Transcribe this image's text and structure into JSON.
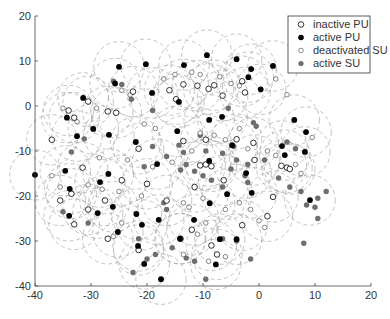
{
  "chart_data": {
    "type": "scatter",
    "title": "",
    "xlabel": "",
    "ylabel": "",
    "xlim": [
      -40,
      20
    ],
    "ylim": [
      -40,
      20
    ],
    "xticks": [
      -40,
      -30,
      -20,
      -10,
      0,
      10,
      20
    ],
    "yticks": [
      -40,
      -30,
      -20,
      -10,
      0,
      10,
      20
    ],
    "grid": false,
    "legend_position": "top-right",
    "coverage_radius": 4.5,
    "series": [
      {
        "name": "inactive PU",
        "marker": "open-circle-large",
        "color": "#000000",
        "points": [
          [
            -22.5,
            3.2
          ],
          [
            -16,
            3.5
          ],
          [
            -13.5,
            4.8
          ],
          [
            -11,
            4.5
          ],
          [
            -9,
            3.8
          ],
          [
            -8,
            4.6
          ],
          [
            -3,
            5.5
          ],
          [
            -30.5,
            1
          ],
          [
            -27,
            -1.2
          ],
          [
            -25.5,
            -1.5
          ],
          [
            -14.8,
            1.5
          ],
          [
            -6.5,
            2.3
          ],
          [
            -2.5,
            3
          ],
          [
            -34,
            -1
          ],
          [
            -33,
            -2.6
          ],
          [
            -37,
            -7.5
          ],
          [
            -21.5,
            -9.5
          ],
          [
            -13.5,
            -7.8
          ],
          [
            -9.5,
            -7.5
          ],
          [
            -4,
            -7.4
          ],
          [
            -1,
            -8.2
          ],
          [
            -31.5,
            -13.7
          ],
          [
            -24.5,
            -16.5
          ],
          [
            -35.5,
            -21
          ],
          [
            -33.5,
            -19.5
          ],
          [
            -30.5,
            -23
          ],
          [
            -27.5,
            -21
          ],
          [
            -20,
            -17.3
          ],
          [
            -16.5,
            -21
          ],
          [
            -11.5,
            -18
          ],
          [
            -10.5,
            -13.2
          ],
          [
            -9.5,
            -13
          ],
          [
            -8.5,
            -13.4
          ],
          [
            -6.3,
            -16.5
          ],
          [
            -0.8,
            -12
          ],
          [
            4,
            -13.3
          ],
          [
            5,
            -13.7
          ],
          [
            5.5,
            -14
          ],
          [
            2.5,
            -20.2
          ],
          [
            1.5,
            -24.5
          ],
          [
            -3,
            -26.5
          ],
          [
            -12,
            -27.5
          ],
          [
            -14,
            -29.5
          ],
          [
            -8.5,
            -31
          ],
          [
            -7.5,
            -33
          ],
          [
            -21.5,
            -32
          ],
          [
            -27,
            -29.5
          ],
          [
            -33,
            -26.3
          ]
        ]
      },
      {
        "name": "active PU",
        "marker": "filled-circle-large",
        "color": "#000000",
        "points": [
          [
            -25,
            8.7
          ],
          [
            -20.2,
            9.3
          ],
          [
            -13.4,
            9.1
          ],
          [
            -9.3,
            11.3
          ],
          [
            -4,
            10.4
          ],
          [
            -1.4,
            8.2
          ],
          [
            2.5,
            8.9
          ],
          [
            -31.4,
            1.8
          ],
          [
            -25.7,
            5
          ],
          [
            -19.1,
            2.9
          ],
          [
            -1.9,
            6.4
          ],
          [
            0.3,
            3.7
          ],
          [
            -34.3,
            -2.6
          ],
          [
            -29.6,
            -5.1
          ],
          [
            -26.8,
            -6.4
          ],
          [
            -32.5,
            -6.7
          ],
          [
            -22,
            -8
          ],
          [
            -14.6,
            -5.6
          ],
          [
            -14.3,
            0.9
          ],
          [
            -8.9,
            -3.1
          ],
          [
            -6.6,
            -2.4
          ],
          [
            6.3,
            -3.1
          ],
          [
            8.4,
            -5.8
          ],
          [
            4.6,
            -10.9
          ],
          [
            8.2,
            -10.2
          ],
          [
            -4.8,
            -8.7
          ],
          [
            -18.2,
            -12.9
          ],
          [
            -34.6,
            -14.4
          ],
          [
            -28.4,
            -16.9
          ],
          [
            -26.9,
            -15.1
          ],
          [
            -28.8,
            -23.8
          ],
          [
            -40,
            -15.3
          ],
          [
            -26.1,
            -22.4
          ],
          [
            -33.9,
            -24.4
          ],
          [
            -33.8,
            -18.4
          ],
          [
            -17.9,
            -25.3
          ],
          [
            -8.9,
            -12.2
          ],
          [
            -8.8,
            -21.6
          ],
          [
            -11.6,
            -25.3
          ],
          [
            -2.3,
            -14.9
          ],
          [
            -5.7,
            -19.6
          ],
          [
            9.1,
            -20.9
          ],
          [
            -7.0,
            -29.6
          ],
          [
            -4.0,
            -29.6
          ],
          [
            -1.3,
            -19.3
          ],
          [
            4.1,
            -8.9
          ],
          [
            -21.6,
            -31.1
          ],
          [
            -21.9,
            -24
          ],
          [
            -20.9,
            -26.4
          ],
          [
            -20.5,
            -35.1
          ],
          [
            -25.2,
            -28
          ],
          [
            -14.1,
            -29.5
          ],
          [
            -17.5,
            -38.5
          ],
          [
            -7.7,
            -35.2
          ]
        ]
      },
      {
        "name": "deactivated SU",
        "marker": "open-circle-small",
        "color": "#555555",
        "points": [
          [
            -35,
            -0.5
          ],
          [
            -32.5,
            -3.5
          ],
          [
            -29,
            -0.5
          ],
          [
            -24.5,
            3.5
          ],
          [
            -23,
            2.5
          ],
          [
            -17,
            6
          ],
          [
            -15,
            7
          ],
          [
            -12,
            7.5
          ],
          [
            -10.5,
            7
          ],
          [
            -7,
            6.5
          ],
          [
            -5,
            5
          ],
          [
            -3.5,
            4.5
          ],
          [
            3,
            6
          ],
          [
            5,
            2.5
          ],
          [
            -20.5,
            -4
          ],
          [
            -18.5,
            -5
          ],
          [
            -10.5,
            -6
          ],
          [
            -8,
            -6.5
          ],
          [
            -6,
            -7.5
          ],
          [
            -3.5,
            -5
          ],
          [
            -2,
            -9.5
          ],
          [
            1.5,
            -10
          ],
          [
            3,
            -11
          ],
          [
            6.5,
            -13
          ],
          [
            7.5,
            -15
          ],
          [
            9.5,
            -7
          ],
          [
            -28.5,
            -11.5
          ],
          [
            -23.5,
            -12
          ],
          [
            -19,
            -13.5
          ],
          [
            -15.5,
            -12.5
          ],
          [
            -12,
            -10
          ],
          [
            -30.5,
            -17.5
          ],
          [
            -28,
            -18.5
          ],
          [
            -25,
            -19
          ],
          [
            -21,
            -20
          ],
          [
            -35.5,
            -18
          ],
          [
            -37,
            -15.5
          ],
          [
            -26,
            -29
          ],
          [
            -24.5,
            -26
          ],
          [
            -13.5,
            -21.5
          ],
          [
            -12.5,
            -22.5
          ],
          [
            -10,
            -20.5
          ],
          [
            -6,
            -23
          ],
          [
            -3.5,
            -21.5
          ],
          [
            -1.5,
            -23
          ],
          [
            0,
            -25.5
          ],
          [
            1,
            -27
          ],
          [
            -9.5,
            -26
          ],
          [
            -11,
            -28.5
          ],
          [
            -13.5,
            -33
          ],
          [
            -9,
            -34.5
          ],
          [
            -6,
            -33.5
          ]
        ]
      },
      {
        "name": "active SU",
        "marker": "filled-circle-gray",
        "color": "#6e6e6e",
        "points": [
          [
            -26,
            5.5
          ],
          [
            -24.5,
            4.8
          ],
          [
            -19,
            -1
          ],
          [
            -22.8,
            1.5
          ],
          [
            -31.2,
            -7.3
          ],
          [
            -33.5,
            -10.2
          ],
          [
            -14.3,
            -8.7
          ],
          [
            -13.5,
            -10.3
          ],
          [
            -10.5,
            -6.5
          ],
          [
            -5.5,
            -0.5
          ],
          [
            -1,
            -3.7
          ],
          [
            -0.5,
            -4.5
          ],
          [
            5,
            -8
          ],
          [
            6.5,
            -9.5
          ],
          [
            -16.5,
            -11.2
          ],
          [
            -9.5,
            -10
          ],
          [
            -6.5,
            -10.5
          ],
          [
            -4.5,
            -9
          ],
          [
            -4,
            -12
          ],
          [
            -2.5,
            -15.5
          ],
          [
            -2,
            -17
          ],
          [
            -6.5,
            -18
          ],
          [
            -8.5,
            -16.5
          ],
          [
            -10,
            -15.5
          ],
          [
            -11.5,
            -14.5
          ],
          [
            -13,
            -13
          ],
          [
            -14,
            -14.2
          ],
          [
            -5,
            -14
          ],
          [
            -2,
            -13
          ],
          [
            1,
            -12
          ],
          [
            3.5,
            -16
          ],
          [
            5.5,
            -18
          ],
          [
            7.5,
            -19
          ],
          [
            10.5,
            -20.5
          ],
          [
            12,
            -19
          ],
          [
            -19,
            -9
          ],
          [
            -20.5,
            -13.5
          ],
          [
            -17,
            -21.5
          ],
          [
            -16.5,
            -23
          ],
          [
            -21.5,
            -29.5
          ],
          [
            -30.5,
            -26
          ],
          [
            -35,
            -23.5
          ],
          [
            -15.5,
            -31.5
          ],
          [
            -13,
            -33.8
          ],
          [
            -11.5,
            -34.5
          ],
          [
            -1.5,
            -34
          ],
          [
            -4,
            -30
          ],
          [
            -6.5,
            -29.5
          ],
          [
            8.5,
            -22
          ],
          [
            10,
            -22.5
          ],
          [
            10.5,
            -25
          ],
          [
            8,
            -30.5
          ],
          [
            -18.5,
            -33
          ],
          [
            -20,
            -34
          ],
          [
            -22.5,
            -37
          ],
          [
            -9.5,
            -38.5
          ]
        ]
      }
    ]
  },
  "legend": {
    "items": [
      {
        "label": "inactive PU",
        "marker": "open-circle-large"
      },
      {
        "label": "active PU",
        "marker": "filled-circle-large"
      },
      {
        "label": "deactivated SU",
        "marker": "open-circle-small"
      },
      {
        "label": "active SU",
        "marker": "filled-circle-gray"
      }
    ]
  }
}
